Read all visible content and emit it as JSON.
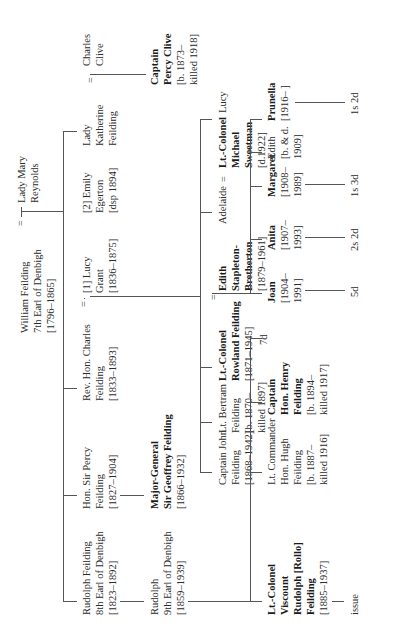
{
  "orientation": "rotated 90 degrees counter-clockwise",
  "generation1": {
    "root": {
      "lines": [
        "William Feilding",
        "7th Earl of Denbigh",
        "[1796–1865]"
      ]
    },
    "spouse_marker": "=",
    "spouse": {
      "lines": [
        "Lady Mary",
        "Reynolds"
      ]
    }
  },
  "generation2": [
    {
      "lines": [
        "Rudolph Feilding",
        "8th Earl of Denbigh",
        "[1823–1892]"
      ],
      "bold": false
    },
    {
      "lines": [
        "Hon. Sir Percy",
        "Feilding",
        "[1827–1904]"
      ],
      "bold": false
    },
    {
      "lines": [
        "Rev. Hon. Charles",
        "Feilding",
        "[1833–1893]"
      ],
      "bold": false
    },
    {
      "spouse_marker": "=",
      "lines": [
        "[1] Lucy",
        "Grant",
        "[1836–1875]"
      ],
      "bold": false
    },
    {
      "lines": [
        "[2] Emily",
        "Egerton",
        "[dsp 1894]"
      ],
      "bold": false
    },
    {
      "lines": [
        "Lady",
        "Katherine",
        "Feilding"
      ],
      "bold": false
    },
    {
      "spouse_marker": "=",
      "lines": [
        "Charles",
        "Clive"
      ],
      "bold": false
    }
  ],
  "generation3": [
    {
      "lines": [
        "Rudolph",
        "9th Earl of Denbigh",
        "[1859–1939]"
      ],
      "bold": false
    },
    {
      "lines": [
        "Major-General",
        "Sir Geoffrey Feilding",
        "[1866–1932]"
      ],
      "bold": true,
      "bold_lines": 2
    },
    {
      "lines": [
        "Captain",
        "Percy Clive",
        "[b. 1873–",
        "killed 1918]"
      ],
      "bold": true,
      "bold_lines": 2
    }
  ],
  "generation3b": [
    {
      "lines": [
        "Captain John",
        "Feilding",
        "[1868–1942]"
      ],
      "bold": false
    },
    {
      "lines": [
        "Lt. Bertram",
        "Feilding",
        "[b. 1870–",
        "killed 1897]"
      ],
      "bold": false
    },
    {
      "lines": [
        "Lt.-Colonel",
        "Rowland Feilding",
        "[1871–1945]"
      ],
      "bold": true,
      "bold_lines": 2
    },
    {
      "spouse_marker": "=",
      "lines": [
        "Edith",
        "Stapleton-",
        "Bretherton",
        "[1879–1961]"
      ],
      "bold": true,
      "bold_lines": 3
    },
    {
      "lines": [
        "Adelaide"
      ],
      "bold": false
    },
    {
      "spouse_marker": "=",
      "lines": [
        "Lt.-Colonel",
        "Michael",
        "Sweetman",
        "[d.1922]"
      ],
      "bold": true,
      "bold_lines": 3
    },
    {
      "lines": [
        "Lucy"
      ],
      "bold": false
    }
  ],
  "generation4": [
    {
      "lines": [
        "Lt.-Colonel",
        "Viscount",
        "Rudolph [Rollo]",
        "Feilding",
        "[1885–1937]"
      ],
      "bold": true,
      "bold_lines": 4,
      "issue": "issue"
    },
    {
      "lines": [
        "Lt. Commander",
        "Hon. Hugh",
        "Feilding",
        "[b. 1887–",
        "killed 1916]"
      ],
      "bold": false
    },
    {
      "lines": [
        "Captain",
        "Hon. Henry",
        "Feilding",
        "[b. 1894–",
        "killed 1917]"
      ],
      "bold": true,
      "bold_lines": 3
    },
    {
      "lines": [
        "7d"
      ],
      "bold": false
    }
  ],
  "generation4b": [
    {
      "lines": [
        "Joan",
        "[1904–",
        "1991]"
      ],
      "bold": true,
      "bold_lines": 1,
      "issue": "5d"
    },
    {
      "lines": [
        "Anita",
        "[1907–",
        "1993]"
      ],
      "bold": true,
      "bold_lines": 1,
      "issue": "2s 2d"
    },
    {
      "lines": [
        "Margaret",
        "[1908–",
        "1989]"
      ],
      "bold": true,
      "bold_lines": 1,
      "issue": "1s 3d"
    },
    {
      "lines": [
        "Edith",
        "[b. & d.",
        "1909]"
      ],
      "bold": false
    },
    {
      "lines": [
        "Prunella",
        "[1916–    ]"
      ],
      "bold": true,
      "bold_lines": 1,
      "issue": "1s 2d"
    }
  ],
  "colors": {
    "line": "#555555",
    "text": "#2a2a2a",
    "background": "#ffffff"
  }
}
